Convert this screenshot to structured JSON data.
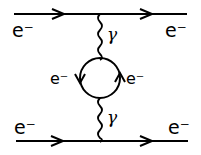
{
  "diagram": {
    "type": "feynman",
    "labels": {
      "top_in": "e⁻",
      "top_out": "e⁻",
      "bottom_in": "e⁻",
      "bottom_out": "e⁻",
      "loop_left": "e⁻",
      "loop_right": "e⁻",
      "photon_top": "γ",
      "photon_bottom": "γ"
    },
    "lines": [
      {
        "kind": "fermion",
        "from": "top-left",
        "to": "top-right"
      },
      {
        "kind": "fermion",
        "from": "bottom-left",
        "to": "bottom-right"
      },
      {
        "kind": "photon",
        "from": "top-vertex",
        "to": "loop-top"
      },
      {
        "kind": "photon",
        "from": "loop-bottom",
        "to": "bottom-vertex"
      },
      {
        "kind": "fermion-loop",
        "orientation": "counterclockwise"
      }
    ],
    "colors": {
      "ink": "#000000",
      "background": "#ffffff"
    }
  }
}
